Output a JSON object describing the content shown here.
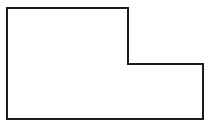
{
  "figure": {
    "name": "l-shaped-polygon",
    "shape_type": "polygon",
    "vertex_count": 6,
    "canvas": {
      "width": 212,
      "height": 127,
      "background_color": "#ffffff"
    },
    "style": {
      "stroke_color": "#1c1c1c",
      "stroke_width": 2,
      "fill_color": "#ffffff",
      "line_join": "miter"
    },
    "vertices": [
      {
        "label": "top-left",
        "x": 7,
        "y": 8
      },
      {
        "label": "top-right",
        "x": 128,
        "y": 8
      },
      {
        "label": "inner-notch-top",
        "x": 128,
        "y": 64
      },
      {
        "label": "inner-notch-right",
        "x": 203,
        "y": 64
      },
      {
        "label": "bottom-right",
        "x": 203,
        "y": 119
      },
      {
        "label": "bottom-left",
        "x": 7,
        "y": 119
      }
    ],
    "points_attr": "7,8 128,8 128,64 203,64 203,119 7,119",
    "edges": [
      {
        "name": "top-edge",
        "from": "top-left",
        "to": "top-right",
        "orientation": "horizontal",
        "length": 121
      },
      {
        "name": "upper-right-edge",
        "from": "top-right",
        "to": "inner-notch-top",
        "orientation": "vertical",
        "length": 56
      },
      {
        "name": "notch-edge",
        "from": "inner-notch-top",
        "to": "inner-notch-right",
        "orientation": "horizontal",
        "length": 75
      },
      {
        "name": "right-edge",
        "from": "inner-notch-right",
        "to": "bottom-right",
        "orientation": "vertical",
        "length": 55
      },
      {
        "name": "bottom-edge",
        "from": "bottom-right",
        "to": "bottom-left",
        "orientation": "horizontal",
        "length": 196
      },
      {
        "name": "left-edge",
        "from": "bottom-left",
        "to": "top-left",
        "orientation": "vertical",
        "length": 111
      }
    ]
  }
}
